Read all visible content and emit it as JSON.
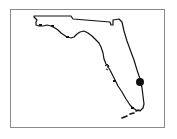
{
  "map": {
    "region": "Florida",
    "outline_color": "#111111",
    "frame_color": "#8a8a8a",
    "background_color": "#ffffff",
    "marker": {
      "label": "location-marker",
      "color": "#111111",
      "x": 140,
      "y": 82,
      "radius": 4
    }
  }
}
